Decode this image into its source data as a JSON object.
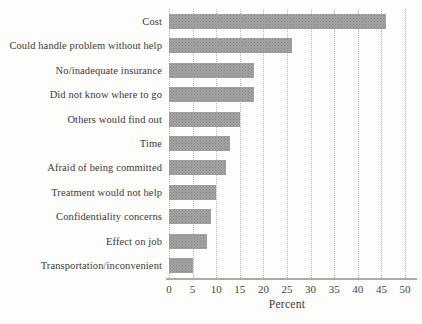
{
  "chart_data": {
    "type": "bar",
    "orientation": "horizontal",
    "title": "",
    "categories": [
      "Cost",
      "Could handle problem without help",
      "No/inadequate insurance",
      "Did not know where to go",
      "Others would find out",
      "Time",
      "Afraid of being committed",
      "Treatment would not help",
      "Confidentiality concerns",
      "Effect on job",
      "Transportation/inconvenient"
    ],
    "values": [
      46,
      26,
      18,
      18,
      15,
      13,
      12,
      10,
      9,
      8,
      5
    ],
    "xlabel": "Percent",
    "xlim": [
      0,
      50
    ],
    "xticks": [
      0,
      5,
      10,
      15,
      20,
      25,
      30,
      35,
      40,
      45,
      50
    ],
    "grid": "dotted-vertical",
    "legend": "none",
    "bar_color": "#9c9c9c",
    "gridline_color": "#b6b6b6",
    "axis_color": "#ababab",
    "text_color": "#3d3936",
    "background_color": "#fdfdfb"
  }
}
